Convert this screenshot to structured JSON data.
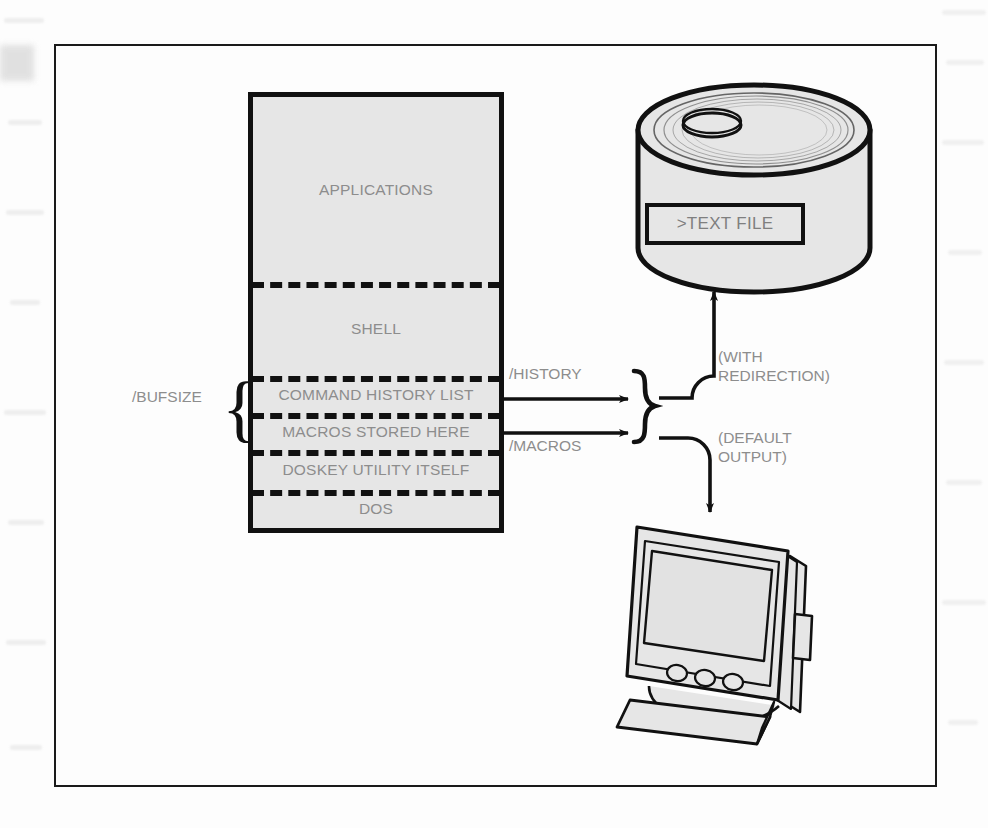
{
  "figure": {
    "kind": "technical-diagram",
    "colors": {
      "ink": "#111111",
      "text_gray": "#8d8d8d",
      "fill_gray": "#e6e6e6",
      "paper": "#fdfdfd"
    }
  },
  "memory_map": {
    "rows": [
      {
        "label": "APPLICATIONS",
        "name": "applications"
      },
      {
        "label": "SHELL",
        "name": "shell"
      },
      {
        "label": "COMMAND HISTORY LIST",
        "name": "command-history-list"
      },
      {
        "label": "MACROS STORED HERE",
        "name": "macros-stored-here"
      },
      {
        "label": "DOSKEY UTILITY ITSELF",
        "name": "doskey-utility-itself"
      },
      {
        "label": "DOS",
        "name": "dos"
      }
    ]
  },
  "annotations": {
    "bufsize": "/BUFSIZE",
    "history": "/HISTORY",
    "macros": "/MACROS",
    "with_redirection_line1": "(WITH",
    "with_redirection_line2": "REDIRECTION)",
    "default_output_line1": "(DEFAULT",
    "default_output_line2": "OUTPUT)"
  },
  "disk": {
    "file_label": ">TEXT FILE",
    "icon": "disk-pack-icon"
  },
  "monitor": {
    "icon": "crt-monitor-icon"
  }
}
